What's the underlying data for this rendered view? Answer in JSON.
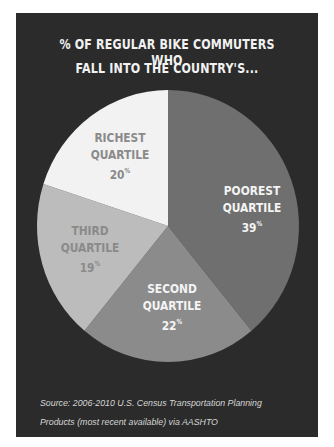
{
  "chart_data": {
    "type": "pie",
    "title": "% OF REGULAR BIKE COMMUTERS WHO FALL INTO THE COUNTRY'S...",
    "categories": [
      "Poorest Quartile",
      "Second Quartile",
      "Third Quartile",
      "Richest Quartile"
    ],
    "values": [
      39,
      22,
      19,
      20
    ],
    "unit": "%",
    "colors": [
      "#6f6f6f",
      "#8b8b8b",
      "#bcbcbc",
      "#f2f2f2"
    ],
    "start_angle": "12 o'clock, clockwise",
    "legend": "none (labels inside slices)",
    "source": "Source: 2006-2010 U.S. Census Transportation Planning Products (most recent available) via AASHTO"
  },
  "title": {
    "line1": "% OF REGULAR BIKE COMMUTERS WHO",
    "line2": "FALL INTO THE COUNTRY'S..."
  },
  "slices": [
    {
      "name1": "POOREST",
      "name2": "QUARTILE",
      "pct": "39",
      "color": "#6f6f6f",
      "text_color": "#f4f4f4"
    },
    {
      "name1": "SECOND",
      "name2": "QUARTILE",
      "pct": "22",
      "color": "#8b8b8b",
      "text_color": "#f4f4f4"
    },
    {
      "name1": "THIRD",
      "name2": "QUARTILE",
      "pct": "19",
      "color": "#bcbcbc",
      "text_color": "#8a8a8a"
    },
    {
      "name1": "RICHEST",
      "name2": "QUARTILE",
      "pct": "20",
      "color": "#f2f2f2",
      "text_color": "#8a8a8a"
    }
  ],
  "percent_sign": "%",
  "source": {
    "line1": "Source: 2006-2010 U.S. Census Transportation Planning",
    "line2": "Products (most recent available) via AASHTO"
  },
  "colors": {
    "background": "#2b2b2b",
    "page": "#ffffff"
  }
}
